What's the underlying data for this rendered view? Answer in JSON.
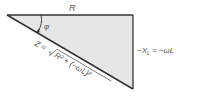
{
  "diagram": {
    "type": "impedance-triangle",
    "labels": {
      "adjacent": "R",
      "angle": "φ",
      "opposite": "−X",
      "opposite_sub": "L",
      "opposite_eq": " = −ωL",
      "hyp_prefix": "Z = ",
      "hyp_radicand": "R² + (−ωL)²"
    },
    "colors": {
      "fill": "#e6e6e6",
      "stroke": "#333333",
      "text": "#555555"
    }
  }
}
